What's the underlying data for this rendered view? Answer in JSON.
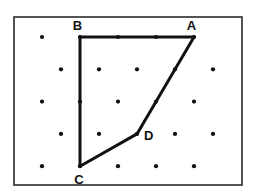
{
  "diagram": {
    "type": "dot-grid-polygon",
    "grid": {
      "kind": "offset-dot-lattice",
      "rows": [
        {
          "row": 0,
          "columns": [
            0,
            2,
            4,
            6,
            8
          ]
        },
        {
          "row": 1,
          "columns": [
            1,
            3,
            5,
            7,
            9
          ]
        },
        {
          "row": 2,
          "columns": [
            0,
            2,
            4,
            6,
            8
          ]
        },
        {
          "row": 3,
          "columns": [
            1,
            3,
            5,
            7,
            9
          ]
        },
        {
          "row": 4,
          "columns": [
            0,
            2,
            4,
            6,
            8
          ]
        }
      ]
    },
    "polygon": {
      "name": "ABCD",
      "vertices": [
        {
          "label": "A",
          "row": 0,
          "col": 8,
          "label_side": "above"
        },
        {
          "label": "B",
          "row": 0,
          "col": 2,
          "label_side": "above"
        },
        {
          "label": "C",
          "row": 4,
          "col": 2,
          "label_side": "below"
        },
        {
          "label": "D",
          "row": 3,
          "col": 5,
          "label_side": "right"
        }
      ],
      "edges": [
        [
          "A",
          "B"
        ],
        [
          "B",
          "C"
        ],
        [
          "C",
          "D"
        ],
        [
          "D",
          "A"
        ]
      ]
    },
    "colors": {
      "ink": "#111111",
      "frame": "#2a2a2a",
      "background": "#ffffff"
    }
  }
}
